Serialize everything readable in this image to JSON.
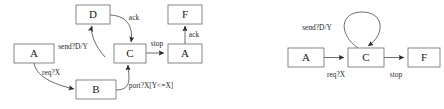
{
  "figure": {
    "background_color": "#ffffff",
    "node_stroke_color": "#7a7a7a",
    "edge_color": "#5a5a5a",
    "text_color": "#1a1a1a"
  },
  "diagrams": [
    {
      "id": "left-diagram",
      "name": "detailed-protocol-diagram",
      "nodes": [
        {
          "id": "n-a1",
          "label": "A",
          "x": 14,
          "y": 44,
          "w": 40,
          "h": 19
        },
        {
          "id": "n-b",
          "label": "B",
          "x": 76,
          "y": 80,
          "w": 40,
          "h": 19
        },
        {
          "id": "n-d",
          "label": "D",
          "x": 76,
          "y": 5,
          "w": 34,
          "h": 19
        },
        {
          "id": "n-c",
          "label": "C",
          "x": 114,
          "y": 44,
          "w": 32,
          "h": 19
        },
        {
          "id": "n-a2",
          "label": "A",
          "x": 168,
          "y": 44,
          "w": 34,
          "h": 19
        },
        {
          "id": "n-f",
          "label": "F",
          "x": 168,
          "y": 5,
          "w": 34,
          "h": 19
        }
      ],
      "edges": [
        {
          "id": "e-a1-b",
          "from": "A",
          "to": "B",
          "label": "req?X",
          "label_x": 51,
          "label_y": 73
        },
        {
          "id": "e-b-c",
          "from": "B",
          "to": "C",
          "label": "port?X[Y<=X]",
          "label_x": 151,
          "label_y": 86
        },
        {
          "id": "e-c-d",
          "from": "C",
          "to": "D",
          "label": "send?D/Y",
          "label_x": 73,
          "label_y": 47
        },
        {
          "id": "e-d-c",
          "from": "D",
          "to": "C",
          "label": "ack",
          "label_x": 134,
          "label_y": 18
        },
        {
          "id": "e-c-a2",
          "from": "C",
          "to": "A",
          "label": "stop",
          "label_x": 157,
          "label_y": 44
        },
        {
          "id": "e-a2-f",
          "from": "A",
          "to": "F",
          "label": "ack",
          "label_x": 194,
          "label_y": 35
        }
      ]
    },
    {
      "id": "right-diagram",
      "name": "abstracted-protocol-diagram",
      "nodes": [
        {
          "id": "n-a",
          "label": "A",
          "x": 288,
          "y": 48,
          "w": 36,
          "h": 19
        },
        {
          "id": "n-c",
          "label": "C",
          "x": 348,
          "y": 48,
          "w": 36,
          "h": 19
        },
        {
          "id": "n-f",
          "label": "F",
          "x": 408,
          "y": 48,
          "w": 32,
          "h": 19
        }
      ],
      "edges": [
        {
          "id": "e-a-c",
          "from": "A",
          "to": "C",
          "label": "req?X",
          "label_x": 336,
          "label_y": 75
        },
        {
          "id": "e-c-f",
          "from": "C",
          "to": "F",
          "label": "stop",
          "label_x": 396,
          "label_y": 75
        },
        {
          "id": "e-c-self",
          "from": "C",
          "to": "C",
          "label": "send?D/Y",
          "label_x": 317,
          "label_y": 28
        }
      ]
    }
  ]
}
